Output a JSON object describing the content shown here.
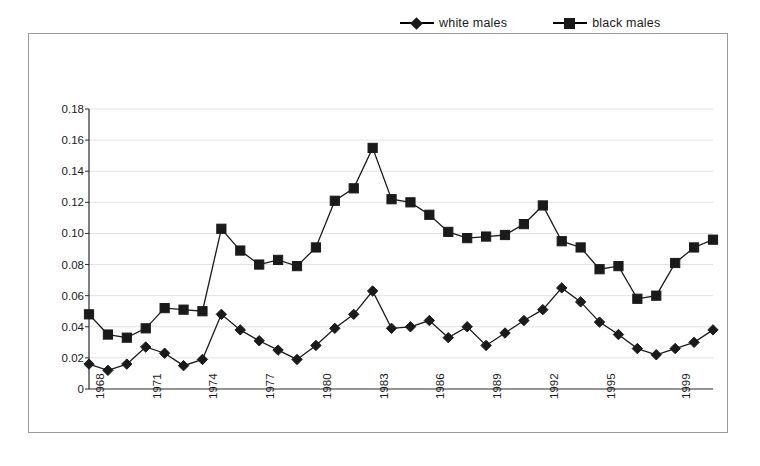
{
  "chart_data": {
    "type": "line",
    "title": "",
    "subtitle": "",
    "xlabel": "",
    "ylabel": "",
    "grid": "horizontal-light",
    "legend_position": "top-right",
    "xlim": [
      1968,
      2001
    ],
    "ylim": [
      0,
      0.18
    ],
    "ytick_labels": [
      "0.18",
      "0.16",
      "0.14",
      "0.12",
      "0.10",
      "0.08",
      "0.06",
      "0.04",
      "0.02",
      "0"
    ],
    "ytick_values": [
      0.18,
      0.16,
      0.14,
      0.12,
      0.1,
      0.08,
      0.06,
      0.04,
      0.02,
      0
    ],
    "xtick_labels": [
      "1968",
      "1971",
      "1974",
      "1977",
      "1980",
      "1983",
      "1986",
      "1989",
      "1992",
      "1995",
      "1999"
    ],
    "xtick_values": [
      1968,
      1971,
      1974,
      1977,
      1980,
      1983,
      1986,
      1989,
      1992,
      1995,
      1999
    ],
    "x": [
      1968,
      1969,
      1970,
      1971,
      1972,
      1973,
      1974,
      1975,
      1976,
      1977,
      1978,
      1979,
      1980,
      1981,
      1982,
      1983,
      1984,
      1985,
      1986,
      1987,
      1988,
      1989,
      1990,
      1991,
      1992,
      1993,
      1994,
      1995,
      1996,
      1997,
      1998,
      1999,
      2000,
      2001
    ],
    "series": [
      {
        "name": "white males",
        "marker": "diamond",
        "color": "#1a1a1a",
        "values": [
          0.016,
          0.012,
          0.016,
          0.027,
          0.023,
          0.015,
          0.019,
          0.048,
          0.038,
          0.031,
          0.025,
          0.019,
          0.028,
          0.039,
          0.048,
          0.063,
          0.039,
          0.04,
          0.044,
          0.033,
          0.04,
          0.028,
          0.036,
          0.044,
          0.051,
          0.065,
          0.056,
          0.043,
          0.035,
          0.026,
          0.022,
          0.026,
          0.03,
          0.038
        ]
      },
      {
        "name": "black males",
        "marker": "square",
        "color": "#1a1a1a",
        "values": [
          0.048,
          0.035,
          0.033,
          0.039,
          0.052,
          0.051,
          0.05,
          0.103,
          0.089,
          0.08,
          0.083,
          0.079,
          0.091,
          0.121,
          0.129,
          0.155,
          0.122,
          0.12,
          0.112,
          0.101,
          0.097,
          0.098,
          0.099,
          0.106,
          0.118,
          0.095,
          0.091,
          0.077,
          0.079,
          0.058,
          0.06,
          0.081,
          0.091,
          0.096
        ]
      }
    ]
  },
  "legend": {
    "entries": [
      {
        "label": "white males",
        "marker": "diamond"
      },
      {
        "label": "black males",
        "marker": "square"
      }
    ]
  }
}
